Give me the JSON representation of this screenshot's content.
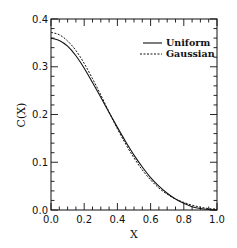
{
  "chart_data": {
    "type": "line",
    "title": "",
    "xlabel": "X",
    "ylabel": "C(X)",
    "xlim": [
      0.0,
      1.0
    ],
    "ylim": [
      0.0,
      0.4
    ],
    "grid": false,
    "legend_position": "upper right",
    "x_ticks": [
      "0.0",
      "0.2",
      "0.4",
      "0.6",
      "0.8",
      "1.0"
    ],
    "y_ticks": [
      "0.0",
      "0.1",
      "0.2",
      "0.3",
      "0.4"
    ],
    "x": [
      0.0,
      0.05,
      0.1,
      0.15,
      0.2,
      0.25,
      0.3,
      0.35,
      0.4,
      0.45,
      0.5,
      0.55,
      0.6,
      0.65,
      0.7,
      0.75,
      0.8,
      0.85,
      0.9,
      0.95,
      1.0
    ],
    "series": [
      {
        "name": "Uniform",
        "style": "solid",
        "values": [
          0.36,
          0.355,
          0.343,
          0.323,
          0.297,
          0.267,
          0.236,
          0.204,
          0.173,
          0.143,
          0.115,
          0.09,
          0.068,
          0.05,
          0.035,
          0.023,
          0.014,
          0.007,
          0.003,
          0.001,
          0.0
        ]
      },
      {
        "name": "Gaussian",
        "style": "dashed",
        "values": [
          0.372,
          0.367,
          0.354,
          0.334,
          0.307,
          0.275,
          0.241,
          0.205,
          0.17,
          0.138,
          0.109,
          0.084,
          0.063,
          0.046,
          0.033,
          0.023,
          0.016,
          0.01,
          0.006,
          0.003,
          0.002
        ]
      }
    ]
  }
}
